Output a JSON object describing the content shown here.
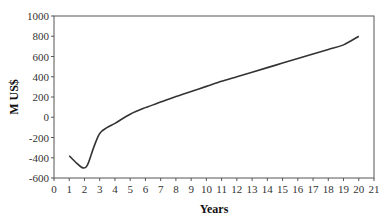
{
  "chart_data": {
    "type": "line",
    "title": "",
    "xlabel": "Years",
    "ylabel": "M US$",
    "xlim": [
      0,
      21
    ],
    "ylim": [
      -600,
      1000
    ],
    "grid": false,
    "legend": null,
    "x_ticks": [
      "0",
      "1",
      "2",
      "3",
      "4",
      "5",
      "6",
      "7",
      "8",
      "9",
      "10",
      "11",
      "12",
      "13",
      "14",
      "15",
      "16",
      "17",
      "18",
      "19",
      "20",
      "21"
    ],
    "y_ticks": [
      "1000",
      "800",
      "600",
      "400",
      "200",
      "0",
      "-200",
      "-400",
      "-600"
    ],
    "series": [
      {
        "name": "M US$",
        "x": [
          1,
          1.5,
          1.9,
          2.2,
          2.6,
          3,
          3.5,
          4,
          5,
          6,
          7,
          8,
          9,
          10,
          11,
          12,
          13,
          14,
          15,
          16,
          17,
          18,
          19,
          20
        ],
        "values": [
          -380,
          -455,
          -500,
          -470,
          -300,
          -160,
          -100,
          -60,
          30,
          95,
          150,
          205,
          255,
          305,
          355,
          400,
          445,
          490,
          535,
          580,
          625,
          670,
          715,
          800
        ]
      }
    ],
    "line_color": "#333333"
  }
}
